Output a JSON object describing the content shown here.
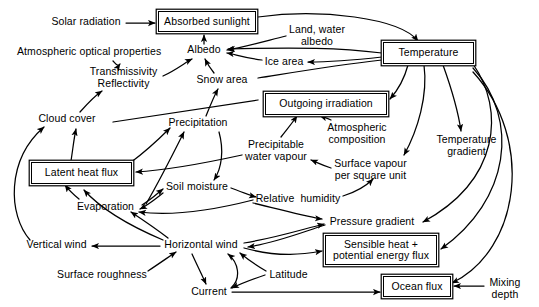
{
  "diagram": {
    "type": "flow-diagram",
    "canvas": {
      "width": 539,
      "height": 307
    },
    "style": {
      "ink": "#000000",
      "paper": "#ffffff"
    },
    "nodes": [
      {
        "id": "solar-radiation",
        "label": "Solar radiation",
        "shape": "plain",
        "x": 48,
        "y": 16,
        "w": 76,
        "h": 14
      },
      {
        "id": "absorbed-sunlight",
        "label": "Absorbed sunlight",
        "shape": "boxed",
        "x": 158,
        "y": 11,
        "w": 98,
        "h": 21
      },
      {
        "id": "land-water-albedo",
        "label": "Land, water\nalbedo",
        "shape": "plain",
        "x": 285,
        "y": 24,
        "w": 64,
        "h": 24
      },
      {
        "id": "temperature",
        "label": "Temperature",
        "shape": "boxed",
        "x": 383,
        "y": 42,
        "w": 91,
        "h": 22
      },
      {
        "id": "atmos-optical",
        "label": "Atmospheric optical properties",
        "shape": "plain",
        "x": 17,
        "y": 46,
        "w": 143,
        "h": 14
      },
      {
        "id": "albedo",
        "label": "Albedo",
        "shape": "plain",
        "x": 185,
        "y": 44,
        "w": 38,
        "h": 14
      },
      {
        "id": "ice-area",
        "label": "Ice area",
        "shape": "plain",
        "x": 263,
        "y": 56,
        "w": 42,
        "h": 14
      },
      {
        "id": "transmissivity",
        "label": "Transmissivity\nReflectivity",
        "shape": "plain",
        "x": 85,
        "y": 66,
        "w": 77,
        "h": 24
      },
      {
        "id": "snow-area",
        "label": "Snow area",
        "shape": "plain",
        "x": 196,
        "y": 74,
        "w": 52,
        "h": 14
      },
      {
        "id": "outgoing-irradiation",
        "label": "Outgoing irradiation",
        "shape": "boxed",
        "x": 265,
        "y": 93,
        "w": 122,
        "h": 22
      },
      {
        "id": "cloud-cover",
        "label": "Cloud cover",
        "shape": "plain",
        "x": 37,
        "y": 113,
        "w": 60,
        "h": 14
      },
      {
        "id": "precipitation",
        "label": "Precipitation",
        "shape": "plain",
        "x": 165,
        "y": 117,
        "w": 66,
        "h": 14
      },
      {
        "id": "atmos-composition",
        "label": "Atmospheric\ncomposition",
        "shape": "plain",
        "x": 323,
        "y": 122,
        "w": 68,
        "h": 24
      },
      {
        "id": "temperature-gradient",
        "label": "Temperature\ngradient",
        "shape": "plain",
        "x": 435,
        "y": 134,
        "w": 63,
        "h": 24
      },
      {
        "id": "precipitable-wv",
        "label": "Precipitable\nwater vapour",
        "shape": "plain",
        "x": 243,
        "y": 139,
        "w": 66,
        "h": 24
      },
      {
        "id": "surface-vapour",
        "label": "Surface vapour\nper square unit",
        "shape": "plain",
        "x": 332,
        "y": 158,
        "w": 77,
        "h": 24
      },
      {
        "id": "latent-heat-flux",
        "label": "Latent heat flux",
        "shape": "boxed",
        "x": 31,
        "y": 162,
        "w": 101,
        "h": 22
      },
      {
        "id": "soil-moisture",
        "label": "Soil moisture",
        "shape": "plain",
        "x": 164,
        "y": 181,
        "w": 66,
        "h": 14
      },
      {
        "id": "relative-humidity",
        "label": "Relative  humidity",
        "shape": "plain",
        "x": 254,
        "y": 193,
        "w": 88,
        "h": 14
      },
      {
        "id": "evaporation",
        "label": "Evaporation",
        "shape": "plain",
        "x": 75,
        "y": 201,
        "w": 61,
        "h": 14
      },
      {
        "id": "pressure-gradient",
        "label": "Pressure gradient",
        "shape": "plain",
        "x": 326,
        "y": 216,
        "w": 92,
        "h": 14
      },
      {
        "id": "sensible-heat",
        "label": "Sensible heat +\npotential energy flux",
        "shape": "boxed",
        "x": 325,
        "y": 235,
        "w": 112,
        "h": 30
      },
      {
        "id": "vertical-wind",
        "label": "Vertical wind",
        "shape": "plain",
        "x": 24,
        "y": 239,
        "w": 65,
        "h": 14
      },
      {
        "id": "horizontal-wind",
        "label": "Horizontal wind",
        "shape": "plain",
        "x": 160,
        "y": 239,
        "w": 82,
        "h": 14
      },
      {
        "id": "surface-roughness",
        "label": "Surface roughness",
        "shape": "plain",
        "x": 57,
        "y": 269,
        "w": 90,
        "h": 14
      },
      {
        "id": "latitude",
        "label": "Latitude",
        "shape": "plain",
        "x": 267,
        "y": 269,
        "w": 43,
        "h": 14
      },
      {
        "id": "current",
        "label": "Current",
        "shape": "plain",
        "x": 189,
        "y": 286,
        "w": 40,
        "h": 14
      },
      {
        "id": "ocean-flux",
        "label": "Ocean flux",
        "shape": "boxed",
        "x": 383,
        "y": 276,
        "w": 68,
        "h": 21
      },
      {
        "id": "mixing-depth",
        "label": "Mixing\ndepth",
        "shape": "plain",
        "x": 486,
        "y": 277,
        "w": 38,
        "h": 24
      }
    ],
    "edges": [
      {
        "from": "solar-radiation",
        "to": "absorbed-sunlight",
        "path": "M126,23 L155,23"
      },
      {
        "from": "albedo",
        "to": "absorbed-sunlight",
        "path": "M204,44 L204,35"
      },
      {
        "from": "land-water-albedo",
        "to": "albedo",
        "path": "M286,36 C262,42 240,48 227,50"
      },
      {
        "from": "temperature",
        "to": "absorbed-sunlight",
        "path": "M258,17 C320,8 400,18 418,41"
      },
      {
        "from": "temperature",
        "to": "albedo",
        "path": "M382,53 C340,48 300,47 228,49"
      },
      {
        "from": "ice-area",
        "to": "albedo",
        "path": "M262,60 C245,58 234,54 227,53"
      },
      {
        "from": "temperature",
        "to": "ice-area",
        "path": "M382,57 C355,60 330,62 308,62"
      },
      {
        "from": "temperature",
        "to": "snow-area-line",
        "path": "M382,60 C330,66 290,73 258,78"
      },
      {
        "from": "temperature",
        "to": "outgoing-irradiation",
        "path": "M408,65 C404,80 398,90 390,99"
      },
      {
        "from": "transmissivity",
        "to": "albedo",
        "path": "M163,76 C176,70 186,62 192,59"
      },
      {
        "from": "atmos-optical",
        "to": "transmissivity",
        "path": "M113,61 C116,64 118,67 120,64"
      },
      {
        "from": "cloud-cover",
        "to": "transmissivity",
        "path": "M80,112 C88,103 96,95 102,91"
      },
      {
        "from": "snow-area",
        "to": "albedo",
        "path": "M214,73 C210,68 207,63 205,59"
      },
      {
        "from": "precipitation-line",
        "to": "snow-area",
        "path": "M113,122 L258,100"
      },
      {
        "from": "precipitation",
        "to": "snow-area",
        "path": "M206,116 C210,106 214,96 218,89"
      },
      {
        "from": "precipitable-wv",
        "to": "outgoing-irradiation",
        "path": "M281,137 C288,128 293,122 297,116"
      },
      {
        "from": "atmos-composition",
        "to": "outgoing-irradiation",
        "path": "M331,120 C327,118 323,117 320,116"
      },
      {
        "from": "temperature",
        "to": "surface-vapour",
        "path": "M424,65 C428,95 418,130 404,155"
      },
      {
        "from": "temperature",
        "to": "temperature-gradient",
        "path": "M443,65 C452,90 458,110 461,131"
      },
      {
        "from": "surface-vapour",
        "to": "precipitable-wv",
        "path": "M331,168 C322,165 316,162 311,160"
      },
      {
        "from": "precipitable-wv",
        "to": "latent-heat-flux",
        "path": "M242,155 C210,162 170,170 136,172"
      },
      {
        "from": "precipitation",
        "to": "soil-moisture",
        "path": "M219,132 C224,150 222,168 214,180"
      },
      {
        "from": "latent-heat-flux",
        "to": "precipitation",
        "path": "M130,163 C145,152 160,138 170,128"
      },
      {
        "from": "latent-heat-flux",
        "to": "cloud-cover",
        "path": "M71,161 C73,148 74,138 76,129"
      },
      {
        "from": "evaporation",
        "to": "latent-heat-flux",
        "path": "M79,199 C72,193 68,189 65,185"
      },
      {
        "from": "evaporation",
        "to": "precipitation",
        "path": "M146,204 C160,180 174,152 184,132"
      },
      {
        "from": "evaporation",
        "to": "soil-moisture",
        "path": "M142,205 C152,199 158,193 163,189"
      },
      {
        "from": "soil-moisture",
        "to": "evaporation",
        "path": "M163,193 C154,200 148,205 140,209"
      },
      {
        "from": "soil-moisture",
        "to": "relative-humidity",
        "path": "M231,188 C244,193 252,196 256,197"
      },
      {
        "from": "relative-humidity",
        "to": "surface-vapour",
        "path": "M343,196 C356,192 366,186 373,179"
      },
      {
        "from": "relative-humidity",
        "to": "evaporation",
        "path": "M253,200 C210,211 170,216 139,212"
      },
      {
        "from": "relative-humidity",
        "to": "pressure-gradient",
        "path": "M253,203 C290,212 312,218 322,219"
      },
      {
        "from": "horizontal-wind",
        "to": "evaporation",
        "path": "M168,238 C155,228 140,218 131,212"
      },
      {
        "from": "horizontal-wind",
        "to": "vertical-wind",
        "path": "M160,246 L92,246"
      },
      {
        "from": "horizontal-wind",
        "to": "latent-heat-flux",
        "path": "M163,240 C130,226 100,208 84,190"
      },
      {
        "from": "vertical-wind",
        "to": "cloud-cover",
        "path": "M30,240 C8,215 6,160 44,127"
      },
      {
        "from": "surface-roughness",
        "to": "horizontal-wind",
        "path": "M148,271 C160,263 170,256 176,252"
      },
      {
        "from": "horizontal-wind",
        "to": "current",
        "path": "M192,254 C197,265 202,275 206,284"
      },
      {
        "from": "current",
        "to": "horizontal-wind",
        "path": "M231,288 C242,278 238,262 228,254"
      },
      {
        "from": "latitude",
        "to": "horizontal-wind",
        "path": "M266,271 C254,264 246,258 240,253"
      },
      {
        "from": "latitude",
        "to": "current",
        "path": "M265,275 C250,280 240,284 232,288"
      },
      {
        "from": "horizontal-wind",
        "to": "sensible-heat",
        "path": "M244,248 C280,258 305,254 322,251"
      },
      {
        "from": "horizontal-wind",
        "to": "pressure-gradient",
        "path": "M244,243 C275,238 300,230 324,224"
      },
      {
        "from": "pressure-gradient",
        "to": "horizontal-wind",
        "path": "M325,225 C300,233 275,243 248,247"
      },
      {
        "from": "temperature",
        "to": "pressure-gradient",
        "path": "M473,64 C505,110 500,180 423,222"
      },
      {
        "from": "temperature",
        "to": "sensible-heat",
        "path": "M473,68 C520,120 510,200 441,249"
      },
      {
        "from": "temperature",
        "to": "ocean-flux",
        "path": "M473,72 C535,140 520,250 452,283"
      },
      {
        "from": "current",
        "to": "ocean-flux",
        "path": "M232,292 L380,292"
      },
      {
        "from": "mixing-depth",
        "to": "ocean-flux",
        "path": "M484,286 L454,286"
      }
    ]
  }
}
